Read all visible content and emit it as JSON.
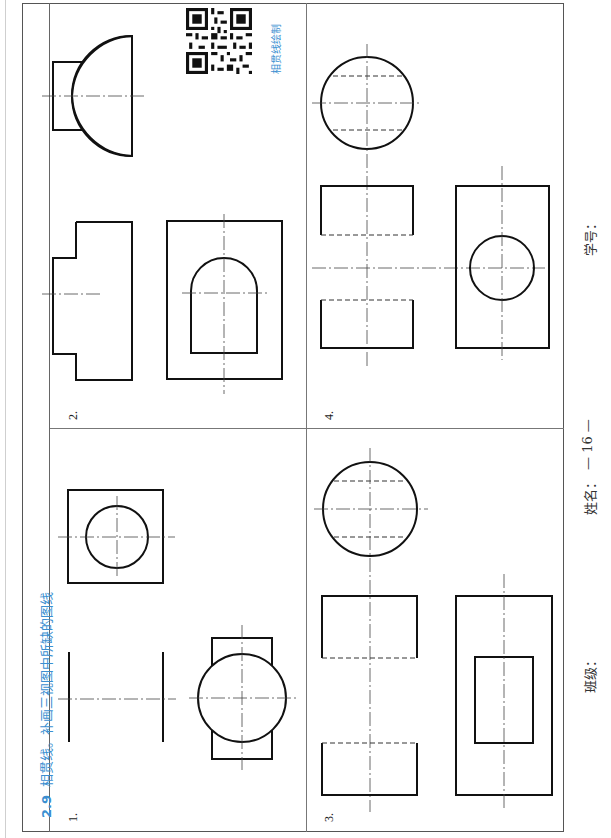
{
  "section": {
    "number": "2.9",
    "title": "相贯线。补画三视图中所缺的图线"
  },
  "qr": {
    "caption": "相贯线绘制"
  },
  "problems": [
    {
      "label": "1."
    },
    {
      "label": "2."
    },
    {
      "label": "3."
    },
    {
      "label": "4."
    }
  ],
  "footer": {
    "class_label": "班级：",
    "name_label": "姓名：",
    "page_number": "— 16 —",
    "student_id_label": "学号："
  },
  "colors": {
    "accent": "#3b8fd1",
    "line": "#111111"
  }
}
